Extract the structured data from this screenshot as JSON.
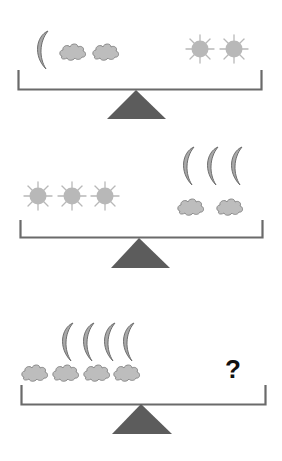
{
  "colors": {
    "beam": "#6a6a6a",
    "fulcrum": "#5c5c5c",
    "sun": "#b8b8b8",
    "cloud_fill": "#bdbdbd",
    "cloud_stroke": "#8a8a8a",
    "moon_fill": "#a8a8a8",
    "moon_stroke": "#6e6e6e",
    "question": "#111111"
  },
  "scales": [
    {
      "name": "scale-1",
      "left_items": [
        "moon",
        "cloud",
        "cloud"
      ],
      "right_items": [
        "sun",
        "sun"
      ]
    },
    {
      "name": "scale-2",
      "left_items": [
        "sun",
        "sun",
        "sun"
      ],
      "right_items": [
        "moon",
        "moon",
        "moon",
        "cloud",
        "cloud"
      ]
    },
    {
      "name": "scale-3",
      "left_items": [
        "moon",
        "moon",
        "moon",
        "moon",
        "cloud",
        "cloud",
        "cloud",
        "cloud"
      ],
      "right_items": [
        "unknown"
      ]
    }
  ],
  "question_mark": "?"
}
